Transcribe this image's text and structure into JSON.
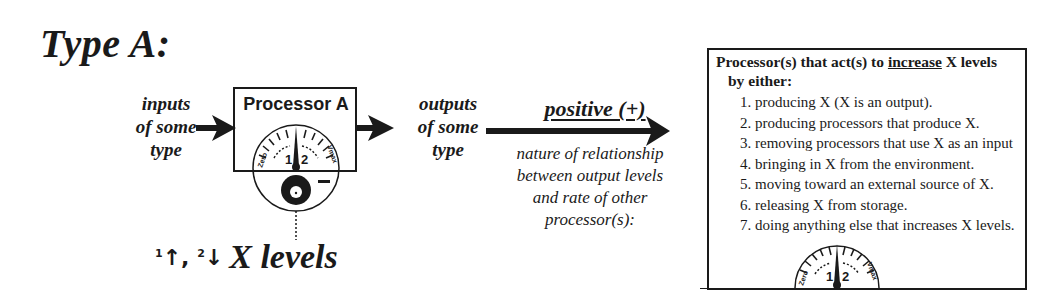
{
  "title": "Type A:",
  "inputs_label": [
    "inputs",
    "of some",
    "type"
  ],
  "processor": {
    "label": "Processor A",
    "gauge": {
      "left_label": "Zero",
      "right_label": "Vmax",
      "mark_1": "1",
      "mark_2": "2"
    },
    "minus_sign": "—"
  },
  "outputs_label": [
    "outputs",
    "of some",
    "type"
  ],
  "relationship": {
    "label": "positive (+)",
    "description": [
      "nature of relationship",
      "between output levels",
      "and rate of other",
      "processor(s):"
    ]
  },
  "x_levels": {
    "arrow_1": "↑",
    "arrow_2": "↓",
    "sup_1": "1",
    "sup_2": "2",
    "separator": ", ",
    "label": "X levels"
  },
  "info_box": {
    "heading_pre": "Processor(s) that act(s) to ",
    "heading_emph": "increase",
    "heading_post": " X levels",
    "heading_line2": "by either:",
    "items": [
      "1. producing X (X is an output).",
      "2. producing processors that produce X.",
      "3. removing processors that use X as an input",
      "4. bringing in X from the environment.",
      "5. moving toward an external source of X.",
      "6. releasing X from storage.",
      "7. doing anything else that increases X levels."
    ],
    "gauge": {
      "left_label": "Zero",
      "right_label": "Vmax",
      "mark_1": "1",
      "mark_2": "2"
    }
  }
}
